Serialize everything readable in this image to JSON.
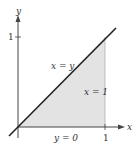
{
  "diagram": {
    "axes": {
      "x_label": "x",
      "y_label": "y",
      "x_tick_label": "1",
      "y_tick_label": "1"
    },
    "labels": {
      "diagonal": "x = y",
      "vertical": "x = 1",
      "bottom": "y = 0"
    },
    "colors": {
      "shade": "#e3e3e3",
      "line": "#222222",
      "axis": "#444444"
    }
  }
}
